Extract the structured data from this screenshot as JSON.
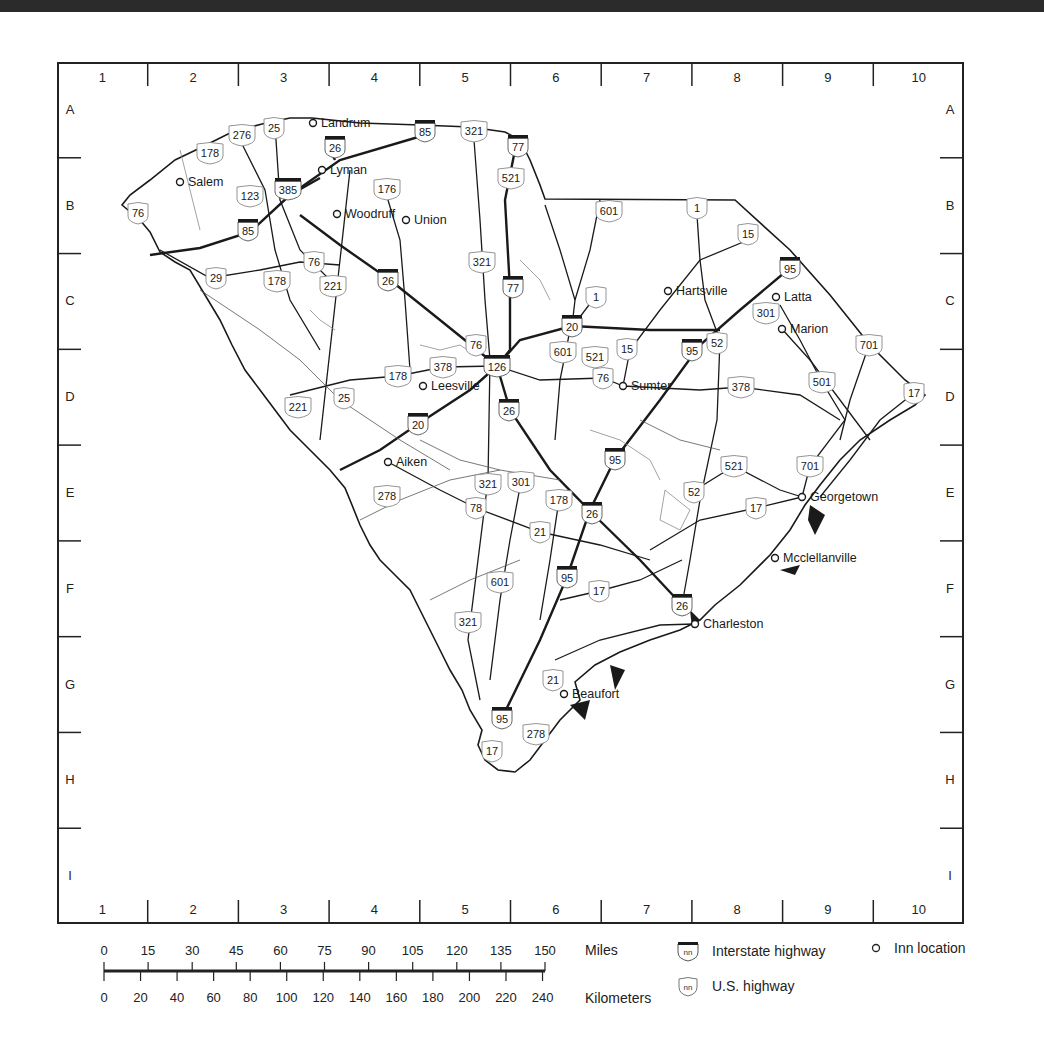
{
  "map": {
    "title": "South Carolina inn locations and highways",
    "grid": {
      "columns": [
        "1",
        "2",
        "3",
        "4",
        "5",
        "6",
        "7",
        "8",
        "9",
        "10"
      ],
      "rows": [
        "A",
        "B",
        "C",
        "D",
        "E",
        "F",
        "G",
        "H",
        "I"
      ]
    },
    "inns": [
      {
        "name": "Landrum",
        "x": 313,
        "y": 123
      },
      {
        "name": "Lyman",
        "x": 322,
        "y": 170
      },
      {
        "name": "Salem",
        "x": 180,
        "y": 182
      },
      {
        "name": "Woodruff",
        "x": 337,
        "y": 214
      },
      {
        "name": "Union",
        "x": 406,
        "y": 220
      },
      {
        "name": "Hartsville",
        "x": 668,
        "y": 291
      },
      {
        "name": "Latta",
        "x": 776,
        "y": 297
      },
      {
        "name": "Marion",
        "x": 782,
        "y": 329
      },
      {
        "name": "Sumter",
        "x": 623,
        "y": 386
      },
      {
        "name": "Leesville",
        "x": 423,
        "y": 386
      },
      {
        "name": "Aiken",
        "x": 388,
        "y": 462
      },
      {
        "name": "Georgetown",
        "x": 802,
        "y": 497
      },
      {
        "name": "Mcclellanville",
        "x": 775,
        "y": 558
      },
      {
        "name": "Charleston",
        "x": 695,
        "y": 624
      },
      {
        "name": "Beaufort",
        "x": 564,
        "y": 694
      }
    ],
    "interstates": [
      {
        "num": "85",
        "x": 425,
        "y": 131
      },
      {
        "num": "26",
        "x": 335,
        "y": 147
      },
      {
        "num": "77",
        "x": 518,
        "y": 146
      },
      {
        "num": "385",
        "x": 288,
        "y": 189
      },
      {
        "num": "85",
        "x": 248,
        "y": 230
      },
      {
        "num": "26",
        "x": 388,
        "y": 280
      },
      {
        "num": "77",
        "x": 513,
        "y": 287
      },
      {
        "num": "95",
        "x": 790,
        "y": 268
      },
      {
        "num": "20",
        "x": 572,
        "y": 326
      },
      {
        "name": "126",
        "num": "126",
        "x": 497,
        "y": 366
      },
      {
        "num": "95",
        "x": 692,
        "y": 350
      },
      {
        "num": "26",
        "x": 509,
        "y": 410
      },
      {
        "num": "20",
        "x": 418,
        "y": 424
      },
      {
        "num": "95",
        "x": 615,
        "y": 459
      },
      {
        "num": "26",
        "x": 592,
        "y": 513
      },
      {
        "num": "95",
        "x": 567,
        "y": 577
      },
      {
        "num": "26",
        "x": 682,
        "y": 605
      },
      {
        "num": "95",
        "x": 502,
        "y": 718
      }
    ],
    "us_highways": [
      {
        "num": "276",
        "x": 242,
        "y": 135
      },
      {
        "num": "25",
        "x": 274,
        "y": 128
      },
      {
        "num": "321",
        "x": 474,
        "y": 131
      },
      {
        "num": "178",
        "x": 210,
        "y": 153
      },
      {
        "num": "176",
        "x": 387,
        "y": 189
      },
      {
        "num": "521",
        "x": 511,
        "y": 178
      },
      {
        "name": "123",
        "num": "123",
        "x": 250,
        "y": 196
      },
      {
        "num": "76",
        "x": 138,
        "y": 213
      },
      {
        "num": "601",
        "x": 609,
        "y": 211
      },
      {
        "num": "1",
        "x": 697,
        "y": 208
      },
      {
        "num": "15",
        "x": 748,
        "y": 234
      },
      {
        "num": "321",
        "x": 482,
        "y": 262
      },
      {
        "num": "29",
        "x": 216,
        "y": 278
      },
      {
        "num": "178",
        "x": 277,
        "y": 281
      },
      {
        "num": "76",
        "x": 314,
        "y": 262
      },
      {
        "num": "221",
        "x": 333,
        "y": 286
      },
      {
        "num": "1",
        "x": 596,
        "y": 297
      },
      {
        "num": "301",
        "x": 766,
        "y": 313
      },
      {
        "num": "701",
        "x": 869,
        "y": 345
      },
      {
        "num": "76",
        "x": 476,
        "y": 345
      },
      {
        "num": "378",
        "x": 443,
        "y": 367
      },
      {
        "num": "601",
        "x": 563,
        "y": 352
      },
      {
        "num": "521",
        "x": 595,
        "y": 357
      },
      {
        "num": "15",
        "x": 627,
        "y": 349
      },
      {
        "num": "52",
        "x": 717,
        "y": 343
      },
      {
        "num": "178",
        "x": 398,
        "y": 376
      },
      {
        "num": "76",
        "x": 603,
        "y": 378
      },
      {
        "num": "378",
        "x": 741,
        "y": 387
      },
      {
        "num": "501",
        "x": 822,
        "y": 382
      },
      {
        "num": "17",
        "x": 914,
        "y": 393
      },
      {
        "num": "221",
        "x": 298,
        "y": 407
      },
      {
        "num": "25",
        "x": 344,
        "y": 398
      },
      {
        "num": "521",
        "x": 734,
        "y": 466
      },
      {
        "num": "701",
        "x": 810,
        "y": 466
      },
      {
        "num": "278",
        "x": 387,
        "y": 496
      },
      {
        "num": "321",
        "x": 488,
        "y": 484
      },
      {
        "num": "301",
        "x": 521,
        "y": 482
      },
      {
        "num": "178",
        "x": 559,
        "y": 500
      },
      {
        "num": "52",
        "x": 694,
        "y": 492
      },
      {
        "num": "78",
        "x": 476,
        "y": 508
      },
      {
        "num": "17",
        "x": 756,
        "y": 508
      },
      {
        "num": "21",
        "x": 540,
        "y": 532
      },
      {
        "num": "601",
        "x": 500,
        "y": 582
      },
      {
        "num": "17",
        "x": 599,
        "y": 591
      },
      {
        "num": "321",
        "x": 468,
        "y": 622
      },
      {
        "num": "21",
        "x": 553,
        "y": 680
      },
      {
        "num": "278",
        "x": 536,
        "y": 734
      },
      {
        "num": "17",
        "x": 492,
        "y": 751
      }
    ]
  },
  "scale_bar": {
    "miles_label": "Miles",
    "kilometers_label": "Kilometers",
    "miles": [
      "0",
      "15",
      "30",
      "45",
      "60",
      "75",
      "90",
      "105",
      "120",
      "135",
      "150"
    ],
    "kilometers": [
      "0",
      "20",
      "40",
      "60",
      "80",
      "100",
      "120",
      "140",
      "160",
      "180",
      "200",
      "220",
      "240"
    ]
  },
  "legend": {
    "interstate": {
      "icon_text": "nn",
      "label": "Interstate highway"
    },
    "us_highway": {
      "icon_text": "nn",
      "label": "U.S. highway"
    },
    "inn": {
      "label": "Inn location"
    }
  },
  "colors": {
    "line": "#1a1a1a",
    "thin_line": "#555555",
    "water": "#8a8a8a",
    "top_band": "#2b2b2b"
  }
}
